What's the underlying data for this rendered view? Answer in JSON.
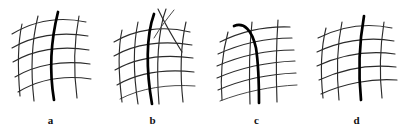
{
  "figure": {
    "background_color": "#ffffff",
    "width": 407,
    "height": 137,
    "line_color": "#2b2b2b",
    "faint_line_color": "#4a4a4a",
    "highlight_color": "#000000",
    "label_color": "#111111"
  },
  "panels": [
    {
      "id": "a",
      "label": "a",
      "description": "Curvilinear quadrilateral mesh tilted to the right with one bold vertical curve through the middle",
      "bold_curve_index": 2,
      "vertical_curves": 4,
      "horizontal_curves": 5,
      "curves": {
        "vertical": [
          "M 22,24 C 18,42 17,62 20,96",
          "M 38,16 C 32,40 30,66 34,101",
          "M 58,12 C 51,40 49,70 54,100",
          "M 79,16 C 74,42 73,68 77,98"
        ],
        "horizontal": [
          "M 12,34 C 32,22 58,16 86,22",
          "M 12,48 C 32,36 60,31 88,36",
          "M 13,62 C 33,50 61,45 89,50",
          "M 15,77 C 35,65 62,60 90,64",
          "M 18,92 C 38,80 64,75 91,79"
        ],
        "bold": "M 58,12 C 51,40 49,70 54,100"
      }
    },
    {
      "id": "b",
      "label": "b",
      "description": "Mesh whose vertical curves splay apart and cross near the top, bold curve curves strongly left at top",
      "bold_curve_index": 2,
      "vertical_curves": 4,
      "horizontal_curves": 5,
      "curves": {
        "vertical": [
          "M 20,30 C 16,48 16,70 20,102",
          "M 36,22 C 31,46 31,72 36,104",
          "M 64,9 C 50,34 48,68 54,104",
          "M 84,22 C 78,48 78,74 81,102"
        ],
        "horizontal": [
          "M 12,42 C 32,30 60,25 88,32",
          "M 12,56 C 32,44 61,40 90,45",
          "M 13,70 C 34,58 62,54 91,58",
          "M 15,85 C 36,73 64,69 92,72",
          "M 18,99 C 39,88 66,84 93,86"
        ],
        "bold": "M 52,14 C 44,36 44,70 50,104",
        "extra": [
          "M 70,8 C 62,20 56,30 50,44",
          "M 56,9 C 62,22 68,34 74,48"
        ]
      }
    },
    {
      "id": "c",
      "label": "c",
      "description": "Mesh bent sharply so horizontal curves sweep up to the right and vertical curves run nearly straight down; bold curve hooks over at top left",
      "bold_curve_index": 1,
      "vertical_curves": 3,
      "horizontal_curves": 6,
      "curves": {
        "vertical": [
          "M 22,32 C 16,54 14,76 16,100",
          "M 46,22 C 43,50 43,76 44,104",
          "M 72,20 C 70,48 70,76 71,102"
        ],
        "horizontal": [
          "M 14,42 C 34,32 58,26 84,27",
          "M 12,54 C 34,44 60,38 86,38",
          "M 11,66 C 34,56 62,50 88,50",
          "M 11,78 C 34,68 63,62 89,61",
          "M 12,90 C 35,80 64,74 90,73",
          "M 14,101 C 37,92 66,86 91,85"
        ],
        "bold": "M 28,26 C 38,22 46,30 50,48 C 53,68 53,86 53,103"
      }
    },
    {
      "id": "d",
      "label": "d",
      "description": "Regular curvilinear mesh, nearly symmetric, with one bold vertical curve slightly left of center",
      "bold_curve_index": 2,
      "vertical_curves": 4,
      "horizontal_curves": 5,
      "curves": {
        "vertical": [
          "M 20,28 C 15,48 14,70 17,98",
          "M 36,22 C 31,46 30,70 33,100",
          "M 58,16 C 53,44 52,70 55,100",
          "M 78,22 C 74,48 73,72 76,98"
        ],
        "horizontal": [
          "M 12,38 C 32,28 58,22 86,28",
          "M 11,52 C 32,42 60,36 88,41",
          "M 11,66 C 33,56 61,50 89,54",
          "M 13,80 C 35,70 63,64 90,67",
          "M 15,94 C 37,84 65,78 91,80"
        ],
        "bold": "M 58,16 C 53,44 52,70 55,100"
      }
    }
  ]
}
